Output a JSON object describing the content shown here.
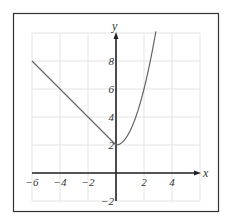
{
  "chart_data": {
    "type": "line",
    "title": "",
    "xlabel": "x",
    "ylabel": "y",
    "xlim": [
      -6,
      6
    ],
    "ylim": [
      -2,
      10
    ],
    "grid": true,
    "x_ticks": [
      -6,
      -4,
      -2,
      2,
      4
    ],
    "y_ticks": [
      -2,
      2,
      4,
      6,
      8
    ],
    "x_tick_labels": [
      "−6",
      "−4",
      "−2",
      "2",
      "4"
    ],
    "y_tick_labels": [
      "−2",
      "2",
      "4",
      "6",
      "8"
    ],
    "series": [
      {
        "name": "piecewise-left",
        "formula": "y = -x + 2, x ≤ 0",
        "x": [
          -6,
          -4,
          -2,
          0
        ],
        "y": [
          8,
          6,
          4,
          2
        ]
      },
      {
        "name": "piecewise-right",
        "formula": "y = x^2 + 2, x ≥ 0",
        "x": [
          0,
          0.5,
          1,
          1.5,
          2,
          2.5,
          2.85
        ],
        "y": [
          2,
          2.25,
          3,
          4.25,
          6,
          8.25,
          10.12
        ]
      }
    ],
    "colors": {
      "curve": "#666666",
      "axis": "#222222",
      "grid": "#e4e4e4",
      "frame": "#333333"
    }
  }
}
